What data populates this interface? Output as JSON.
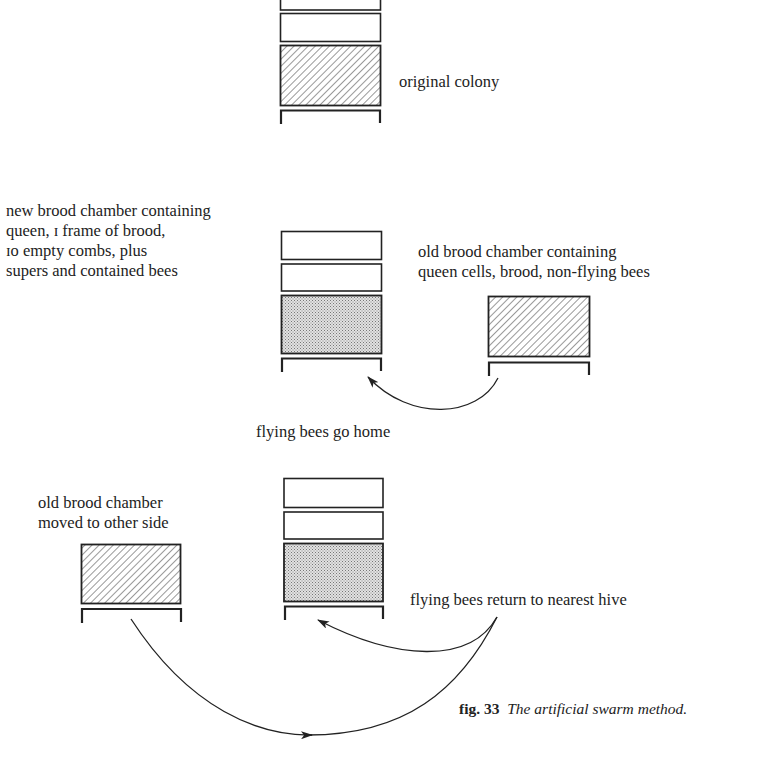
{
  "figure": {
    "number": "fig. 33",
    "title": "The artificial swarm method."
  },
  "stages": [
    {
      "id": "stage-1",
      "label": "original colony",
      "hives": [
        {
          "role": "original colony",
          "parts": [
            "super",
            "super",
            "brood-hatched",
            "stand"
          ]
        }
      ]
    },
    {
      "id": "stage-2",
      "labels": {
        "new_hive": [
          "new brood chamber containing",
          "queen, I frame of brood,",
          "10 empty combs, plus",
          "supers and contained bees"
        ],
        "old_hive": [
          "old brood chamber containing",
          "queen cells, brood, non-flying bees"
        ],
        "arrow": "flying bees go home"
      },
      "hives": [
        {
          "role": "new brood chamber",
          "parts": [
            "super",
            "super",
            "brood-stippled",
            "stand"
          ]
        },
        {
          "role": "old brood chamber",
          "parts": [
            "brood-hatched",
            "stand"
          ]
        }
      ]
    },
    {
      "id": "stage-3",
      "labels": {
        "old_hive": [
          "old brood chamber",
          "moved to other side"
        ],
        "arrow": "flying bees return to nearest hive"
      },
      "hives": [
        {
          "role": "old brood chamber moved",
          "parts": [
            "brood-hatched",
            "stand"
          ]
        },
        {
          "role": "new brood chamber",
          "parts": [
            "super",
            "super",
            "brood-stippled",
            "stand"
          ]
        }
      ]
    }
  ],
  "text": {
    "original_colony": "original colony",
    "new_l1": "new brood chamber containing",
    "new_l2": "queen, ɪ frame of brood,",
    "new_l3": "ɪo empty combs, plus",
    "new_l4": "supers and contained bees",
    "old_l1": "old brood chamber containing",
    "old_l2": "queen cells, brood, non-flying bees",
    "go_home": "flying bees go home",
    "moved_l1": "old brood chamber",
    "moved_l2": "moved to other side",
    "return_nearest": "flying bees return to nearest hive",
    "fig_num": "fig. 33",
    "fig_title": "The artificial swarm method."
  },
  "colors": {
    "ink": "#222222",
    "stipple": "#c9c9c9",
    "background": "#ffffff"
  }
}
